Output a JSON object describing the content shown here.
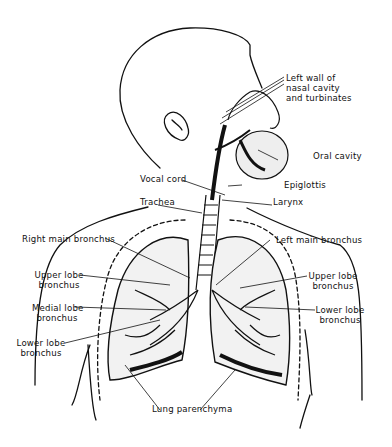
{
  "diagram": {
    "colors": {
      "ink": "#111111",
      "background": "#ffffff"
    },
    "labels": {
      "nasal_1": "Left wall of",
      "nasal_2": "nasal cavity",
      "nasal_3": "and turbinates",
      "oral_cavity": "Oral cavity",
      "vocal_cord": "Vocal cord",
      "epiglottis": "Epiglottis",
      "trachea": "Trachea",
      "larynx": "Larynx",
      "right_main_bronchus": "Right main bronchus",
      "left_main_bronchus": "Left main bronchus",
      "r_upper_lobe_1": "Upper lobe",
      "r_upper_lobe_2": "bronchus",
      "l_upper_lobe_1": "Upper lobe",
      "l_upper_lobe_2": "bronchus",
      "medial_lobe_1": "Medial lobe",
      "medial_lobe_2": "bronchus",
      "l_lower_lobe_1": "Lower lobe",
      "l_lower_lobe_2": "bronchus",
      "r_lower_lobe_1": "Lower lobe",
      "r_lower_lobe_2": "bronchus",
      "lung_parenchyma": "Lung parenchyma"
    }
  }
}
